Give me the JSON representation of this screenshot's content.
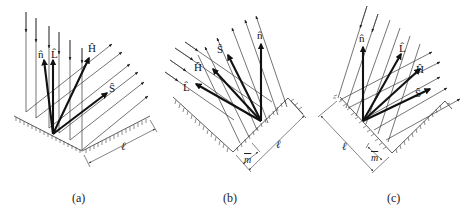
{
  "figure": {
    "panels": [
      {
        "id": "a",
        "caption": "(a)",
        "vector_labels": {
          "n": "n̂",
          "L": "L̂",
          "H": "Ĥ",
          "S": "Ŝ"
        },
        "dimension_labels": {
          "length": "ℓ"
        }
      },
      {
        "id": "b",
        "caption": "(b)",
        "vector_labels": {
          "n": "n̂",
          "L": "L̂",
          "H": "Ĥ",
          "S": "Ŝ"
        },
        "dimension_labels": {
          "length": "ℓ",
          "offset": "m"
        }
      },
      {
        "id": "c",
        "caption": "(c)",
        "vector_labels": {
          "n": "n̂",
          "L": "L̂",
          "H": "Ĥ",
          "S": "Ŝ"
        },
        "dimension_labels": {
          "length": "ℓ",
          "offset": "m"
        }
      }
    ]
  },
  "colors": {
    "ink": "#111111",
    "thin_line": "#3a3a3a",
    "background": "#ffffff"
  }
}
